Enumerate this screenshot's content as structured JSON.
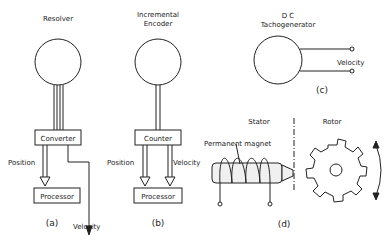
{
  "panel_a": {
    "title": "Resolver",
    "converter": "Converter",
    "processor": "Processor",
    "position": "Position",
    "velocity": "Velocity",
    "caption": "(a)"
  },
  "panel_b": {
    "title_line1": "Incremental",
    "title_line2": "Encoder",
    "counter": "Counter",
    "processor": "Processor",
    "position": "Position",
    "velocity": "Velocity",
    "caption": "(b)"
  },
  "panel_c": {
    "title_line1": "D C",
    "title_line2": "Tachogenerator",
    "velocity": "Velocity",
    "caption": "(c)"
  },
  "panel_d": {
    "stator": "Stator",
    "rotor": "Rotor",
    "magnet": "Permanent magnet",
    "caption": "(d)"
  },
  "colors": {
    "line": "#222222",
    "background": "#ffffff"
  }
}
